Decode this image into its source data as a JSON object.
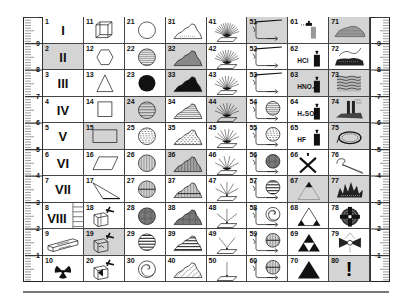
{
  "ruler": {
    "left_labels": [
      "9",
      "8",
      "7",
      "6",
      "5",
      "4",
      "3",
      "2",
      "1"
    ],
    "right_labels": [
      "9",
      "8",
      "7",
      "6",
      "5",
      "4",
      "3",
      "2",
      "1"
    ]
  },
  "cells": [
    {
      "n": "1",
      "sym": "roman",
      "text": "I"
    },
    {
      "n": "2",
      "sym": "roman",
      "text": "II",
      "shaded": true
    },
    {
      "n": "3",
      "sym": "roman",
      "text": "III"
    },
    {
      "n": "4",
      "sym": "roman",
      "text": "IV"
    },
    {
      "n": "5",
      "sym": "roman",
      "text": "V"
    },
    {
      "n": "6",
      "sym": "roman",
      "text": "VI"
    },
    {
      "n": "7",
      "sym": "roman",
      "text": "VII"
    },
    {
      "n": "8",
      "sym": "roman-ladder",
      "text": "VIII"
    },
    {
      "n": "9",
      "sym": "crystal-bar"
    },
    {
      "n": "10",
      "sym": "radiation"
    },
    {
      "n": "11",
      "sym": "cube"
    },
    {
      "n": "12",
      "sym": "hexagon"
    },
    {
      "n": "13",
      "sym": "triangle"
    },
    {
      "n": "14",
      "sym": "square"
    },
    {
      "n": "15",
      "sym": "rectangle",
      "shaded": true
    },
    {
      "n": "16",
      "sym": "parallelogram"
    },
    {
      "n": "17",
      "sym": "thin-triangle"
    },
    {
      "n": "18",
      "sym": "block-hammer"
    },
    {
      "n": "19",
      "sym": "box-hammer",
      "shaded": true
    },
    {
      "n": "20",
      "sym": "split-hammer"
    },
    {
      "n": "21",
      "sym": "circle-empty"
    },
    {
      "n": "22",
      "sym": "circle-hlines"
    },
    {
      "n": "23",
      "sym": "circle-filled"
    },
    {
      "n": "24",
      "sym": "circle-hlines-wide",
      "shaded": true
    },
    {
      "n": "25",
      "sym": "circle-dashes"
    },
    {
      "n": "26",
      "sym": "circle-vlines"
    },
    {
      "n": "27",
      "sym": "circle-cross"
    },
    {
      "n": "28",
      "sym": "circle-grid"
    },
    {
      "n": "29",
      "sym": "circle-bands"
    },
    {
      "n": "30",
      "sym": "circle-speckle"
    },
    {
      "n": "31",
      "sym": "mound-outline"
    },
    {
      "n": "32",
      "sym": "mound-gray",
      "shaded": true
    },
    {
      "n": "33",
      "sym": "mound-black",
      "shaded": true
    },
    {
      "n": "34",
      "sym": "mound-hlines"
    },
    {
      "n": "35",
      "sym": "mound-dashes"
    },
    {
      "n": "36",
      "sym": "mound-vlines",
      "shaded": true
    },
    {
      "n": "37",
      "sym": "mound-cross"
    },
    {
      "n": "38",
      "sym": "mound-grid"
    },
    {
      "n": "39",
      "sym": "mound-bands"
    },
    {
      "n": "40",
      "sym": "mound-speckle"
    },
    {
      "n": "41",
      "sym": "fan-14"
    },
    {
      "n": "42",
      "sym": "fan-12"
    },
    {
      "n": "43",
      "sym": "fan-10"
    },
    {
      "n": "44",
      "sym": "fan-9",
      "shaded": true
    },
    {
      "n": "45",
      "sym": "fan-8"
    },
    {
      "n": "46",
      "sym": "fan-6"
    },
    {
      "n": "47",
      "sym": "fan-5"
    },
    {
      "n": "48",
      "sym": "fan-3"
    },
    {
      "n": "49",
      "sym": "fan-2"
    },
    {
      "n": "50",
      "sym": "fan-1"
    },
    {
      "n": "51",
      "sym": "tube-long",
      "shaded": true
    },
    {
      "n": "52",
      "sym": "tube-long"
    },
    {
      "n": "53",
      "sym": "tube-long"
    },
    {
      "n": "54",
      "sym": "tube-circle-hlines"
    },
    {
      "n": "55",
      "sym": "tube-circle-dashes"
    },
    {
      "n": "56",
      "sym": "tube-circle-grid"
    },
    {
      "n": "57",
      "sym": "tube-circle-bands"
    },
    {
      "n": "58",
      "sym": "tube-circle-speckle"
    },
    {
      "n": "59",
      "sym": "tube-circle-cross"
    },
    {
      "n": "60",
      "sym": "tube-circle-cross"
    },
    {
      "n": "61",
      "sym": "dropper"
    },
    {
      "n": "62",
      "sym": "acid-bottle",
      "text": "HCl"
    },
    {
      "n": "63",
      "sym": "acid-bottle",
      "text": "HNO₃",
      "shaded": true
    },
    {
      "n": "64",
      "sym": "acid-bottle",
      "text": "H₂SO₄"
    },
    {
      "n": "65",
      "sym": "acid-bottle",
      "text": "HF"
    },
    {
      "n": "66",
      "sym": "cross-x"
    },
    {
      "n": "67",
      "sym": "tri-top",
      "shaded": true
    },
    {
      "n": "68",
      "sym": "tri-corners"
    },
    {
      "n": "69",
      "sym": "tri-sierpinski"
    },
    {
      "n": "70",
      "sym": "tri-solid"
    },
    {
      "n": "71",
      "sym": "rock-pile",
      "shaded": true
    },
    {
      "n": "72",
      "sym": "rock-wire"
    },
    {
      "n": "73",
      "sym": "rock-layers",
      "shaded": true
    },
    {
      "n": "74",
      "sym": "rock-pillars",
      "shaded": true
    },
    {
      "n": "75",
      "sym": "ring",
      "shaded": true
    },
    {
      "n": "76",
      "sym": "whip"
    },
    {
      "n": "77",
      "sym": "crystal-cluster",
      "shaded": true
    },
    {
      "n": "78",
      "sym": "target"
    },
    {
      "n": "79",
      "sym": "bowtie"
    },
    {
      "n": "80",
      "sym": "exclamation",
      "text": "!",
      "shaded": true
    }
  ]
}
